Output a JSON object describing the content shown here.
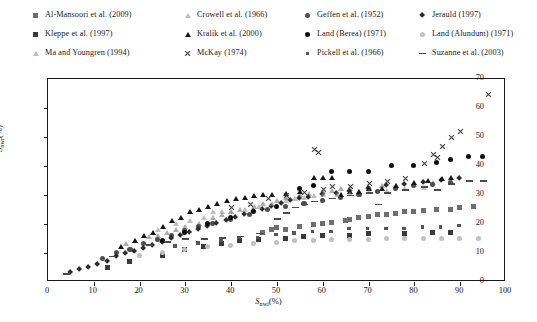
{
  "chart_data": {
    "type": "scatter",
    "title": "",
    "xlabel": "S_nwi (%)",
    "ylabel": "S_nwr (%)",
    "xlim": [
      0,
      100
    ],
    "ylim": [
      0,
      70
    ],
    "xticks": [
      0,
      10,
      20,
      30,
      40,
      50,
      60,
      70,
      80,
      90,
      100
    ],
    "yticks": [
      0,
      10,
      20,
      30,
      40,
      50,
      60,
      70
    ],
    "grid": false,
    "legend_position": "above-plot",
    "series": [
      {
        "name": "Al-Mansoori et al. (2009)",
        "marker": "square",
        "color": "#6e6e6e",
        "points": [
          [
            47,
            17
          ],
          [
            49,
            18
          ],
          [
            50,
            18.5
          ],
          [
            52,
            18
          ],
          [
            55,
            19
          ],
          [
            58,
            19.5
          ],
          [
            60,
            20
          ],
          [
            62,
            20.5
          ],
          [
            65,
            21
          ],
          [
            66,
            21.5
          ],
          [
            68,
            22
          ],
          [
            70,
            22.5
          ],
          [
            72,
            23
          ],
          [
            74,
            23
          ],
          [
            76,
            23.5
          ],
          [
            78,
            24
          ],
          [
            80,
            24
          ],
          [
            82,
            24.5
          ],
          [
            85,
            25
          ],
          [
            88,
            25
          ],
          [
            90,
            25.5
          ],
          [
            93,
            26
          ]
        ]
      },
      {
        "name": "Crowell et al. (1966)",
        "marker": "triangle-up-open",
        "color": "#6a6a6a",
        "points": [
          [
            17,
            13
          ],
          [
            19,
            14
          ],
          [
            22,
            15.5
          ],
          [
            24,
            16
          ],
          [
            26,
            17
          ],
          [
            28,
            18
          ],
          [
            30,
            19
          ],
          [
            33,
            20
          ],
          [
            36,
            22
          ],
          [
            38,
            23
          ],
          [
            40,
            24
          ],
          [
            42,
            25
          ],
          [
            45,
            26
          ],
          [
            47,
            27
          ],
          [
            50,
            28
          ],
          [
            52,
            29
          ],
          [
            55,
            30
          ],
          [
            57,
            30.5
          ],
          [
            60,
            31
          ],
          [
            62,
            31.5
          ],
          [
            64,
            32
          ],
          [
            66,
            32
          ],
          [
            70,
            32.5
          ],
          [
            73,
            33
          ],
          [
            76,
            33
          ],
          [
            80,
            33.5
          ],
          [
            84,
            34
          ]
        ]
      },
      {
        "name": "Geffen et al. (1952)",
        "marker": "circle",
        "color": "#4d4d4d",
        "points": [
          [
            12,
            8
          ],
          [
            15,
            10
          ],
          [
            18,
            11
          ],
          [
            21,
            13
          ],
          [
            24,
            14.5
          ],
          [
            27,
            16
          ],
          [
            30,
            17.5
          ],
          [
            33,
            19
          ],
          [
            36,
            20
          ],
          [
            40,
            21.5
          ],
          [
            44,
            23
          ],
          [
            48,
            25
          ],
          [
            52,
            26
          ],
          [
            56,
            27
          ],
          [
            60,
            28
          ],
          [
            64,
            29
          ],
          [
            68,
            30
          ],
          [
            72,
            31
          ],
          [
            76,
            32
          ],
          [
            80,
            33
          ],
          [
            84,
            33.5
          ],
          [
            88,
            34
          ]
        ]
      },
      {
        "name": "Jerauld (1997)",
        "marker": "diamond",
        "color": "#2b2b2b",
        "points": [
          [
            5,
            3
          ],
          [
            7,
            4
          ],
          [
            9,
            5
          ],
          [
            11,
            6
          ],
          [
            13,
            7
          ],
          [
            15,
            8.5
          ],
          [
            17,
            9.5
          ],
          [
            19,
            10.5
          ],
          [
            21,
            11.5
          ],
          [
            23,
            12.5
          ],
          [
            25,
            13.5
          ],
          [
            27,
            15
          ],
          [
            29,
            16
          ],
          [
            31,
            17
          ],
          [
            33,
            18
          ],
          [
            35,
            19
          ],
          [
            37,
            20
          ],
          [
            39,
            21
          ],
          [
            41,
            22
          ],
          [
            43,
            23
          ],
          [
            45,
            24
          ],
          [
            47,
            25
          ],
          [
            49,
            26
          ],
          [
            51,
            27
          ],
          [
            53,
            28
          ],
          [
            55,
            28.5
          ],
          [
            57,
            29
          ],
          [
            60,
            30
          ],
          [
            63,
            30.5
          ],
          [
            66,
            31
          ],
          [
            70,
            32
          ],
          [
            74,
            33
          ],
          [
            78,
            33.5
          ],
          [
            82,
            34
          ],
          [
            86,
            35
          ],
          [
            90,
            35.5
          ]
        ]
      },
      {
        "name": "Kleppe et al. (1997)",
        "marker": "square",
        "color": "#3a3a3a",
        "points": [
          [
            13,
            5
          ],
          [
            18,
            7
          ],
          [
            25,
            9
          ],
          [
            30,
            11
          ],
          [
            34,
            12
          ],
          [
            38,
            13
          ],
          [
            42,
            14
          ],
          [
            46,
            14.5
          ],
          [
            52,
            15
          ],
          [
            56,
            15.5
          ],
          [
            60,
            16
          ],
          [
            66,
            16
          ],
          [
            70,
            16.5
          ],
          [
            78,
            16.5
          ],
          [
            84,
            17
          ],
          [
            88,
            17
          ]
        ]
      },
      {
        "name": "Kralik et al. (2000)",
        "marker": "triangle-up",
        "color": "#161616",
        "points": [
          [
            16,
            12
          ],
          [
            19,
            14
          ],
          [
            21,
            16
          ],
          [
            23,
            17
          ],
          [
            25,
            19
          ],
          [
            27,
            21
          ],
          [
            29,
            22
          ],
          [
            31,
            24
          ],
          [
            33,
            25
          ],
          [
            35,
            26
          ],
          [
            37,
            27
          ],
          [
            39,
            28
          ],
          [
            41,
            28.5
          ],
          [
            43,
            29
          ],
          [
            45,
            29.5
          ],
          [
            47,
            30
          ],
          [
            49,
            30
          ],
          [
            52,
            30.5
          ],
          [
            55,
            31
          ],
          [
            58,
            36
          ],
          [
            60,
            36
          ],
          [
            62,
            36
          ],
          [
            64,
            30
          ],
          [
            66,
            31
          ],
          [
            68,
            31
          ],
          [
            70,
            32
          ],
          [
            73,
            32
          ],
          [
            76,
            33
          ],
          [
            80,
            34
          ],
          [
            83,
            35
          ],
          [
            86,
            35.5
          ],
          [
            88,
            36
          ]
        ]
      },
      {
        "name": "Land (Berea) (1971)",
        "marker": "circle",
        "color": "#0d0d0d",
        "points": [
          [
            25,
            14
          ],
          [
            30,
            17
          ],
          [
            35,
            20
          ],
          [
            40,
            22
          ],
          [
            45,
            24
          ],
          [
            50,
            26
          ],
          [
            55,
            32
          ],
          [
            58,
            33
          ],
          [
            62,
            38
          ],
          [
            66,
            38
          ],
          [
            70,
            38
          ],
          [
            75,
            40
          ],
          [
            80,
            40
          ],
          [
            85,
            41
          ],
          [
            88,
            42
          ],
          [
            92,
            43
          ],
          [
            95,
            43
          ]
        ]
      },
      {
        "name": "Land (Alundum) (1971)",
        "marker": "circle",
        "color": "#c0c0c0",
        "points": [
          [
            20,
            9
          ],
          [
            25,
            10
          ],
          [
            30,
            11
          ],
          [
            35,
            12
          ],
          [
            40,
            12.5
          ],
          [
            45,
            13
          ],
          [
            50,
            13.5
          ],
          [
            54,
            14
          ],
          [
            58,
            14
          ],
          [
            62,
            14.5
          ],
          [
            66,
            14.5
          ],
          [
            70,
            14.5
          ],
          [
            74,
            15
          ],
          [
            78,
            15
          ],
          [
            82,
            15
          ],
          [
            86,
            15
          ],
          [
            90,
            15
          ],
          [
            94,
            15
          ]
        ]
      },
      {
        "name": "Ma and Youngren (1994)",
        "marker": "triangle-up-open",
        "color": "#8a8a8a",
        "points": [
          [
            24,
            18
          ],
          [
            28,
            20
          ],
          [
            31,
            21
          ],
          [
            34,
            22
          ],
          [
            36,
            24
          ],
          [
            38,
            24
          ],
          [
            40,
            24
          ],
          [
            43,
            25
          ],
          [
            46,
            26
          ],
          [
            49,
            27
          ],
          [
            52,
            28
          ],
          [
            54,
            28.5
          ],
          [
            56,
            29
          ],
          [
            58,
            29.5
          ],
          [
            60,
            30
          ],
          [
            63,
            30
          ],
          [
            66,
            30.5
          ],
          [
            70,
            31
          ],
          [
            74,
            31.5
          ],
          [
            78,
            32
          ],
          [
            82,
            32.5
          ]
        ]
      },
      {
        "name": "McKay (1974)",
        "marker": "x",
        "color": "#3a3a3a",
        "points": [
          [
            40,
            26
          ],
          [
            44,
            27
          ],
          [
            48,
            29
          ],
          [
            52,
            30
          ],
          [
            56,
            31
          ],
          [
            58,
            46
          ],
          [
            59,
            45
          ],
          [
            60,
            32
          ],
          [
            62,
            33
          ],
          [
            66,
            33
          ],
          [
            70,
            34
          ],
          [
            74,
            35
          ],
          [
            78,
            36
          ],
          [
            82,
            41
          ],
          [
            84,
            44
          ],
          [
            85,
            43
          ],
          [
            86,
            47
          ],
          [
            88,
            50
          ],
          [
            90,
            52
          ],
          [
            96,
            65
          ]
        ]
      },
      {
        "name": "Pickell et al. (1966)",
        "marker": "square-small",
        "color": "#555555",
        "points": [
          [
            28,
            12
          ],
          [
            33,
            13
          ],
          [
            38,
            14
          ],
          [
            42,
            15
          ],
          [
            46,
            15
          ],
          [
            50,
            16
          ],
          [
            54,
            16.5
          ],
          [
            58,
            17
          ],
          [
            62,
            17
          ],
          [
            66,
            18
          ],
          [
            70,
            18
          ],
          [
            74,
            18
          ],
          [
            78,
            18
          ],
          [
            82,
            18.5
          ],
          [
            86,
            18.5
          ],
          [
            90,
            19
          ]
        ]
      },
      {
        "name": "Suzanne et al. (2003)",
        "marker": "dash",
        "color": "#4a4a4a",
        "points": [
          [
            4,
            2
          ],
          [
            14,
            8
          ],
          [
            22,
            12
          ],
          [
            26,
            13
          ],
          [
            30,
            14
          ],
          [
            34,
            14
          ],
          [
            38,
            14.5
          ],
          [
            42,
            15
          ],
          [
            46,
            16
          ],
          [
            50,
            21
          ],
          [
            52,
            23
          ],
          [
            54,
            25
          ],
          [
            56,
            26
          ],
          [
            58,
            27
          ],
          [
            62,
            28
          ],
          [
            66,
            29
          ],
          [
            70,
            30
          ],
          [
            72,
            26
          ],
          [
            74,
            30
          ],
          [
            78,
            31
          ],
          [
            82,
            32
          ],
          [
            85,
            31
          ],
          [
            88,
            33
          ],
          [
            92,
            34
          ],
          [
            95,
            34
          ]
        ]
      }
    ]
  },
  "legend": {
    "rows": [
      [
        {
          "label": "Al-Mansoori et al. (2009)",
          "marker": "square-gray"
        },
        {
          "label": "Crowell et al. (1966)",
          "marker": "triangle-open"
        },
        {
          "label": "Geffen et al. (1952)",
          "marker": "circle-gray"
        },
        {
          "label": "Jerauld (1997)",
          "marker": "diamond"
        }
      ],
      [
        {
          "label": "Kleppe et al. (1997)",
          "marker": "square-dark"
        },
        {
          "label": "Kralik et al. (2000)",
          "marker": "triangle-dark"
        },
        {
          "label": "Land (Berea) (1971)",
          "marker": "circle-dark"
        },
        {
          "label": "Land (Alundum) (1971)",
          "marker": "circle-light"
        }
      ],
      [
        {
          "label": "Ma and Youngren (1994)",
          "marker": "triangle-open"
        },
        {
          "label": "McKay (1974)",
          "marker": "x"
        },
        {
          "label": "Pickell et al. (1966)",
          "marker": "square-small"
        },
        {
          "label": "Suzanne et al. (2003)",
          "marker": "dash"
        }
      ]
    ]
  },
  "axes": {
    "x_title_main": "S",
    "x_title_sub": "nwi",
    "x_title_unit": "(%)",
    "y_title_main": "S",
    "y_title_sub": "nwr",
    "y_title_unit": "(%)",
    "x_tick_labels": [
      "0",
      "10",
      "20",
      "30",
      "40",
      "50",
      "60",
      "70",
      "80",
      "90",
      "100"
    ],
    "y_tick_labels": [
      "0",
      "10",
      "20",
      "30",
      "40",
      "50",
      "60",
      "70"
    ]
  }
}
